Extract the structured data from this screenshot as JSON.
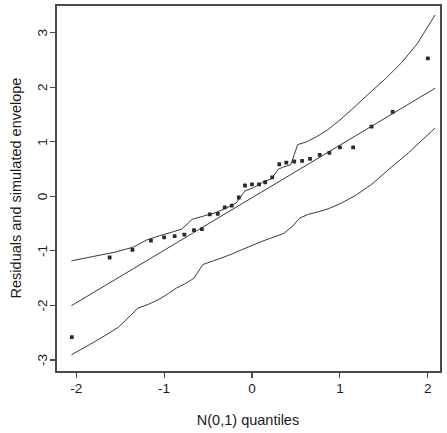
{
  "chart_data": {
    "type": "scatter",
    "title": "",
    "subtitle": "",
    "xlabel": "N(0,1) quantiles",
    "ylabel": "Residuals and simulated envelope",
    "xlim": [
      -2.23,
      2.15
    ],
    "ylim": [
      -3.22,
      3.51
    ],
    "xticks": [
      -2,
      -1,
      0,
      1,
      2
    ],
    "xticklabels": [
      "-2",
      "-1",
      "0",
      "1",
      "2"
    ],
    "yticks": [
      -3,
      -2,
      -1,
      0,
      1,
      2,
      3
    ],
    "yticklabels": [
      "-3",
      "-2",
      "-1",
      "0",
      "1",
      "2",
      "3"
    ],
    "grid": false,
    "legend": false,
    "legend_position": "none",
    "box": true,
    "point_marker": "filled-square",
    "points": [
      {
        "x": -2.05,
        "y": -2.58
      },
      {
        "x": -1.62,
        "y": -1.12
      },
      {
        "x": -1.36,
        "y": -0.98
      },
      {
        "x": -1.15,
        "y": -0.81
      },
      {
        "x": -1.0,
        "y": -0.75
      },
      {
        "x": -0.88,
        "y": -0.73
      },
      {
        "x": -0.77,
        "y": -0.7
      },
      {
        "x": -0.66,
        "y": -0.62
      },
      {
        "x": -0.57,
        "y": -0.6
      },
      {
        "x": -0.48,
        "y": -0.33
      },
      {
        "x": -0.39,
        "y": -0.32
      },
      {
        "x": -0.31,
        "y": -0.2
      },
      {
        "x": -0.23,
        "y": -0.17
      },
      {
        "x": -0.15,
        "y": -0.02
      },
      {
        "x": -0.08,
        "y": 0.2
      },
      {
        "x": 0.0,
        "y": 0.22
      },
      {
        "x": 0.08,
        "y": 0.22
      },
      {
        "x": 0.15,
        "y": 0.26
      },
      {
        "x": 0.23,
        "y": 0.35
      },
      {
        "x": 0.31,
        "y": 0.59
      },
      {
        "x": 0.39,
        "y": 0.62
      },
      {
        "x": 0.48,
        "y": 0.64
      },
      {
        "x": 0.57,
        "y": 0.65
      },
      {
        "x": 0.66,
        "y": 0.69
      },
      {
        "x": 0.77,
        "y": 0.76
      },
      {
        "x": 0.88,
        "y": 0.8
      },
      {
        "x": 1.0,
        "y": 0.9
      },
      {
        "x": 1.15,
        "y": 0.9
      },
      {
        "x": 1.36,
        "y": 1.28
      },
      {
        "x": 1.6,
        "y": 1.55
      },
      {
        "x": 2.0,
        "y": 2.53
      }
    ],
    "series": [
      {
        "name": "upper envelope",
        "type": "line",
        "x": [
          -2.05,
          -1.8,
          -1.55,
          -1.35,
          -1.2,
          -1.05,
          -0.92,
          -0.8,
          -0.68,
          -0.55,
          -0.42,
          -0.3,
          -0.18,
          -0.08,
          0.02,
          0.12,
          0.22,
          0.3,
          0.36,
          0.44,
          0.52,
          0.62,
          0.74,
          0.86,
          1.0,
          1.16,
          1.34,
          1.52,
          1.7,
          1.88,
          2.08
        ],
        "y": [
          -1.18,
          -1.1,
          -1.02,
          -0.93,
          -0.8,
          -0.72,
          -0.66,
          -0.6,
          -0.42,
          -0.36,
          -0.3,
          -0.22,
          -0.12,
          0.1,
          0.16,
          0.26,
          0.32,
          0.5,
          0.54,
          0.58,
          0.95,
          1.0,
          1.1,
          1.22,
          1.4,
          1.63,
          1.9,
          2.16,
          2.45,
          2.8,
          3.32
        ]
      },
      {
        "name": "mean / reference line",
        "type": "line",
        "x": [
          -2.05,
          2.08
        ],
        "y": [
          -2.0,
          1.98
        ]
      },
      {
        "name": "lower envelope",
        "type": "line",
        "x": [
          -2.05,
          -1.85,
          -1.68,
          -1.52,
          -1.38,
          -1.3,
          -1.18,
          -1.05,
          -0.95,
          -0.86,
          -0.76,
          -0.66,
          -0.56,
          -0.44,
          -0.33,
          -0.22,
          -0.12,
          0.0,
          0.12,
          0.24,
          0.36,
          0.46,
          0.54,
          0.64,
          0.76,
          0.88,
          1.02,
          1.18,
          1.36,
          1.56,
          1.78,
          2.08
        ],
        "y": [
          -2.9,
          -2.72,
          -2.56,
          -2.4,
          -2.18,
          -2.05,
          -1.98,
          -1.88,
          -1.78,
          -1.68,
          -1.6,
          -1.5,
          -1.25,
          -1.18,
          -1.12,
          -1.05,
          -0.98,
          -0.9,
          -0.82,
          -0.75,
          -0.68,
          -0.55,
          -0.4,
          -0.33,
          -0.28,
          -0.22,
          -0.12,
          0.02,
          0.22,
          0.5,
          0.8,
          1.25
        ]
      }
    ]
  },
  "axes": {
    "xlabel": "N(0,1) quantiles",
    "ylabel": "Residuals and simulated envelope"
  },
  "colors": {
    "background": "#ffffff",
    "axis": "#4a4a4a",
    "line": "#3a3a3a",
    "point": "#2b2b2b",
    "text": "#1a1a1a"
  }
}
